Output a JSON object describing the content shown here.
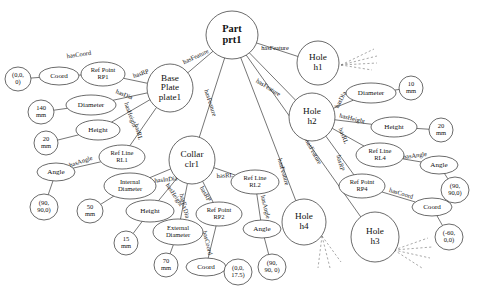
{
  "diagram": {
    "type": "node-link-graph",
    "width": 489,
    "height": 297,
    "background_color": "#ffffff",
    "node_stroke_color": "#2b2b2b",
    "text_color": "#111111",
    "dashed_edge_color": "#6e6e6e"
  },
  "nodes": [
    {
      "id": "prt1",
      "label": "Part\nprt1",
      "line1": "Part",
      "line2": "prt1",
      "shape": "circle",
      "cx": 232,
      "cy": 35,
      "rx": 26,
      "ry": 24,
      "style": "root"
    },
    {
      "id": "plate1",
      "label": "Base Plate plate1",
      "line1": "Base",
      "line2": "Plate",
      "line3": "plate1",
      "shape": "circle",
      "cx": 170,
      "cy": 88,
      "rx": 23,
      "ry": 24,
      "style": "big"
    },
    {
      "id": "clr1",
      "label": "Collar clr1",
      "line1": "Collar",
      "line2": "clr1",
      "shape": "circle",
      "cx": 192,
      "cy": 160,
      "rx": 23,
      "ry": 24,
      "style": "big"
    },
    {
      "id": "h1",
      "label": "Hole h1",
      "line1": "Hole",
      "line2": "h1",
      "shape": "circle",
      "cx": 318,
      "cy": 63,
      "rx": 21,
      "ry": 22,
      "style": "big"
    },
    {
      "id": "h2",
      "label": "Hole h2",
      "line1": "Hole",
      "line2": "h2",
      "shape": "circle",
      "cx": 312,
      "cy": 117,
      "rx": 23,
      "ry": 24,
      "style": "big"
    },
    {
      "id": "h3",
      "label": "Hole h3",
      "line1": "Hole",
      "line2": "h3",
      "shape": "circle",
      "cx": 375,
      "cy": 237,
      "rx": 24,
      "ry": 25,
      "style": "big"
    },
    {
      "id": "h4",
      "label": "Hole h4",
      "line1": "Hole",
      "line2": "h4",
      "shape": "circle",
      "cx": 304,
      "cy": 222,
      "rx": 22,
      "ry": 23,
      "style": "big"
    },
    {
      "id": "coord_p1",
      "label": "Coord",
      "line1": "Coord",
      "shape": "ellipse",
      "cx": 59,
      "cy": 76,
      "rx": 20,
      "ry": 9,
      "style": "normal"
    },
    {
      "id": "rp1",
      "label": "Ref Point RP1",
      "line1": "Ref Point",
      "line2": "RP1",
      "shape": "ellipse",
      "cx": 103,
      "cy": 74,
      "rx": 22,
      "ry": 12,
      "style": "small"
    },
    {
      "id": "val_000_p1",
      "label": "(0,0, 0)",
      "line1": "(0,0,",
      "line2": "0)",
      "shape": "ellipse",
      "cx": 18,
      "cy": 79,
      "rx": 13,
      "ry": 12,
      "style": "small"
    },
    {
      "id": "dia_p1",
      "label": "Diameter",
      "line1": "Diameter",
      "shape": "ellipse",
      "cx": 91,
      "cy": 105,
      "rx": 25,
      "ry": 10,
      "style": "normal"
    },
    {
      "id": "val_140mm",
      "label": "140 mm",
      "line1": "140",
      "line2": "mm",
      "shape": "ellipse",
      "cx": 41,
      "cy": 112,
      "rx": 13,
      "ry": 12,
      "style": "small"
    },
    {
      "id": "hgt_p1",
      "label": "Height",
      "line1": "Height",
      "shape": "ellipse",
      "cx": 98,
      "cy": 130,
      "rx": 22,
      "ry": 10,
      "style": "normal"
    },
    {
      "id": "val_20mm_p1",
      "label": "20 mm",
      "line1": "20",
      "line2": "mm",
      "shape": "ellipse",
      "cx": 46,
      "cy": 143,
      "rx": 12,
      "ry": 12,
      "style": "small"
    },
    {
      "id": "rl1",
      "label": "Ref Line RL1",
      "line1": "Ref Line",
      "line2": "RL1",
      "shape": "ellipse",
      "cx": 122,
      "cy": 157,
      "rx": 23,
      "ry": 12,
      "style": "small"
    },
    {
      "id": "ang_p1",
      "label": "Angle",
      "line1": "Angle",
      "shape": "ellipse",
      "cx": 56,
      "cy": 172,
      "rx": 19,
      "ry": 9,
      "style": "normal"
    },
    {
      "id": "val_ang_p1",
      "label": "(90, 90,0)",
      "line1": "(90,",
      "line2": "90,0)",
      "shape": "ellipse",
      "cx": 44,
      "cy": 207,
      "rx": 14,
      "ry": 13,
      "style": "small"
    },
    {
      "id": "india_c",
      "label": "Internal Diameter",
      "line1": "Internal",
      "line2": "Diameter",
      "shape": "ellipse",
      "cx": 130,
      "cy": 186,
      "rx": 26,
      "ry": 13,
      "style": "small"
    },
    {
      "id": "val_50mm",
      "label": "50 mm",
      "line1": "50",
      "line2": "mm",
      "shape": "ellipse",
      "cx": 90,
      "cy": 211,
      "rx": 13,
      "ry": 12,
      "style": "small"
    },
    {
      "id": "hgt_c",
      "label": "Height",
      "line1": "Height",
      "shape": "ellipse",
      "cx": 150,
      "cy": 211,
      "rx": 24,
      "ry": 11,
      "style": "normal"
    },
    {
      "id": "val_15mm",
      "label": "15 mm",
      "line1": "15",
      "line2": "mm",
      "shape": "ellipse",
      "cx": 126,
      "cy": 243,
      "rx": 12,
      "ry": 12,
      "style": "small"
    },
    {
      "id": "exdia_c",
      "label": "External Diameter",
      "line1": "External",
      "line2": "Diameter",
      "shape": "ellipse",
      "cx": 178,
      "cy": 232,
      "rx": 25,
      "ry": 13,
      "style": "small"
    },
    {
      "id": "val_70mm",
      "label": "70 mm",
      "line1": "70",
      "line2": "mm",
      "shape": "ellipse",
      "cx": 166,
      "cy": 265,
      "rx": 12,
      "ry": 12,
      "style": "small"
    },
    {
      "id": "rp2",
      "label": "Ref Point RP2",
      "line1": "Ref Point",
      "line2": "RP2",
      "shape": "ellipse",
      "cx": 219,
      "cy": 214,
      "rx": 23,
      "ry": 12,
      "style": "small"
    },
    {
      "id": "coord_c",
      "label": "Coord",
      "line1": "Coord",
      "shape": "ellipse",
      "cx": 206,
      "cy": 267,
      "rx": 20,
      "ry": 9,
      "style": "normal"
    },
    {
      "id": "val_00175",
      "label": "(0,0, 17.5)",
      "line1": "(0,0,",
      "line2": "17.5)",
      "shape": "ellipse",
      "cx": 238,
      "cy": 272,
      "rx": 14,
      "ry": 13,
      "style": "small"
    },
    {
      "id": "rl2",
      "label": "Ref Line RL2",
      "line1": "Ref Line",
      "line2": "RL2",
      "shape": "ellipse",
      "cx": 255,
      "cy": 182,
      "rx": 24,
      "ry": 12,
      "style": "small"
    },
    {
      "id": "ang_c",
      "label": "Angle",
      "line1": "Angle",
      "shape": "ellipse",
      "cx": 262,
      "cy": 229,
      "rx": 19,
      "ry": 9,
      "style": "normal"
    },
    {
      "id": "val_ang_c",
      "label": "(90, 90, 0)",
      "line1": "(90,",
      "line2": "90, 0)",
      "shape": "ellipse",
      "cx": 272,
      "cy": 267,
      "rx": 14,
      "ry": 13,
      "style": "small"
    },
    {
      "id": "dia_h2",
      "label": "Diameter",
      "line1": "Diameter",
      "shape": "ellipse",
      "cx": 371,
      "cy": 93,
      "rx": 25,
      "ry": 10,
      "style": "normal"
    },
    {
      "id": "val_10mm",
      "label": "10 mm",
      "line1": "10",
      "line2": "mm",
      "shape": "ellipse",
      "cx": 411,
      "cy": 88,
      "rx": 12,
      "ry": 12,
      "style": "small"
    },
    {
      "id": "hgt_h2",
      "label": "Height",
      "line1": "Height",
      "shape": "ellipse",
      "cx": 394,
      "cy": 127,
      "rx": 23,
      "ry": 10,
      "style": "normal"
    },
    {
      "id": "val_20mm_h2",
      "label": "20 mm",
      "line1": "20",
      "line2": "mm",
      "shape": "ellipse",
      "cx": 441,
      "cy": 130,
      "rx": 12,
      "ry": 12,
      "style": "small"
    },
    {
      "id": "rl4",
      "label": "Ref Line RL4",
      "line1": "Ref Line",
      "line2": "RL4",
      "shape": "ellipse",
      "cx": 380,
      "cy": 155,
      "rx": 24,
      "ry": 12,
      "style": "small"
    },
    {
      "id": "ang_h2",
      "label": "Angle",
      "line1": "Angle",
      "shape": "ellipse",
      "cx": 439,
      "cy": 165,
      "rx": 19,
      "ry": 9,
      "style": "normal"
    },
    {
      "id": "val_ang_h2",
      "label": "(90, 90,0)",
      "line1": "(90,",
      "line2": "90,0)",
      "shape": "ellipse",
      "cx": 455,
      "cy": 190,
      "rx": 14,
      "ry": 13,
      "style": "small"
    },
    {
      "id": "rp4",
      "label": "Ref Point RP4",
      "line1": "Ref Point",
      "line2": "RP4",
      "shape": "ellipse",
      "cx": 362,
      "cy": 186,
      "rx": 23,
      "ry": 12,
      "style": "small"
    },
    {
      "id": "coord_h2",
      "label": "Coord",
      "line1": "Coord",
      "shape": "ellipse",
      "cx": 432,
      "cy": 207,
      "rx": 20,
      "ry": 9,
      "style": "normal"
    },
    {
      "id": "val_m60",
      "label": "(-60, 0,0)",
      "line1": "(-60,",
      "line2": "0,0)",
      "shape": "ellipse",
      "cx": 449,
      "cy": 237,
      "rx": 14,
      "ry": 13,
      "style": "small"
    }
  ],
  "edges": [
    {
      "id": "e1",
      "from": "prt1",
      "to": "h1",
      "label": "hasFeature",
      "lx": 275,
      "ly": 49,
      "rot": 0
    },
    {
      "id": "e2",
      "from": "prt1",
      "to": "plate1",
      "label": "hasFeature",
      "lx": 196,
      "ly": 57,
      "rot": -25
    },
    {
      "id": "e3",
      "from": "prt1",
      "to": "clr1",
      "label": "hasFeature",
      "lx": 210,
      "ly": 103,
      "rot": 72
    },
    {
      "id": "e4",
      "from": "prt1",
      "to": "h2",
      "label": "hasFeature",
      "lx": 268,
      "ly": 88,
      "rot": 32
    },
    {
      "id": "e5",
      "from": "prt1",
      "to": "h4",
      "label": "hasFeature",
      "lx": 283,
      "ly": 172,
      "rot": 74
    },
    {
      "id": "e6",
      "from": "prt1",
      "to": "h3",
      "label": "hasFeature",
      "lx": 313,
      "ly": 152,
      "rot": 61
    },
    {
      "id": "e7",
      "from": "plate1",
      "to": "rp1",
      "label": "hasRP",
      "lx": 141,
      "ly": 74,
      "rot": -18
    },
    {
      "id": "e8",
      "from": "rp1",
      "to": "coord_p1",
      "label": "hasCoord",
      "lx": 79,
      "ly": 55,
      "rot": -8
    },
    {
      "id": "e9",
      "from": "coord_p1",
      "to": "val_000_p1",
      "label": "",
      "lx": 0,
      "ly": 0,
      "rot": 0
    },
    {
      "id": "e10",
      "from": "plate1",
      "to": "dia_p1",
      "label": "hasDia",
      "lx": 124,
      "ly": 95,
      "rot": 22
    },
    {
      "id": "e11",
      "from": "dia_p1",
      "to": "val_140mm",
      "label": "",
      "lx": 0,
      "ly": 0,
      "rot": 0
    },
    {
      "id": "e12",
      "from": "plate1",
      "to": "hgt_p1",
      "label": "hasHeight",
      "lx": 130,
      "ly": 115,
      "rot": 70
    },
    {
      "id": "e13",
      "from": "hgt_p1",
      "to": "val_20mm_p1",
      "label": "",
      "lx": 0,
      "ly": 0,
      "rot": 0
    },
    {
      "id": "e14",
      "from": "plate1",
      "to": "rl1",
      "label": "hasRL",
      "lx": 138,
      "ly": 132,
      "rot": 74
    },
    {
      "id": "e15",
      "from": "rl1",
      "to": "ang_p1",
      "label": "hasAngle",
      "lx": 81,
      "ly": 162,
      "rot": -19
    },
    {
      "id": "e16",
      "from": "ang_p1",
      "to": "val_ang_p1",
      "label": "",
      "lx": 0,
      "ly": 0,
      "rot": 0
    },
    {
      "id": "e17",
      "from": "clr1",
      "to": "india_c",
      "label": "hasInDia",
      "lx": 166,
      "ly": 180,
      "rot": -6
    },
    {
      "id": "e18",
      "from": "india_c",
      "to": "val_50mm",
      "label": "",
      "lx": 0,
      "ly": 0,
      "rot": 0
    },
    {
      "id": "e19",
      "from": "clr1",
      "to": "hgt_c",
      "label": "hasHeight",
      "lx": 174,
      "ly": 195,
      "rot": 56
    },
    {
      "id": "e20",
      "from": "hgt_c",
      "to": "val_15mm",
      "label": "",
      "lx": 0,
      "ly": 0,
      "rot": 0
    },
    {
      "id": "e21",
      "from": "clr1",
      "to": "exdia_c",
      "label": "hasExDia",
      "lx": 184,
      "ly": 206,
      "rot": 76
    },
    {
      "id": "e22",
      "from": "exdia_c",
      "to": "val_70mm",
      "label": "",
      "lx": 0,
      "ly": 0,
      "rot": 0
    },
    {
      "id": "e23",
      "from": "clr1",
      "to": "rp2",
      "label": "hasRP",
      "lx": 205,
      "ly": 194,
      "rot": 60
    },
    {
      "id": "e24",
      "from": "rp2",
      "to": "coord_c",
      "label": "hasCoord",
      "lx": 207,
      "ly": 243,
      "rot": 76
    },
    {
      "id": "e25",
      "from": "coord_c",
      "to": "val_00175",
      "label": "",
      "lx": 0,
      "ly": 0,
      "rot": 0
    },
    {
      "id": "e26",
      "from": "clr1",
      "to": "rl2",
      "label": "hasRL",
      "lx": 225,
      "ly": 176,
      "rot": -3
    },
    {
      "id": "e27",
      "from": "rl2",
      "to": "ang_c",
      "label": "hasAngle",
      "lx": 265,
      "ly": 207,
      "rot": 76
    },
    {
      "id": "e28",
      "from": "ang_c",
      "to": "val_ang_c",
      "label": "",
      "lx": 0,
      "ly": 0,
      "rot": 0
    },
    {
      "id": "e29",
      "from": "h2",
      "to": "dia_h2",
      "label": "hasDia",
      "lx": 341,
      "ly": 100,
      "rot": -62
    },
    {
      "id": "e30",
      "from": "dia_h2",
      "to": "val_10mm",
      "label": "",
      "lx": 0,
      "ly": 0,
      "rot": 0
    },
    {
      "id": "e31",
      "from": "h2",
      "to": "hgt_h2",
      "label": "hasHeight",
      "lx": 352,
      "ly": 119,
      "rot": 14
    },
    {
      "id": "e32",
      "from": "hgt_h2",
      "to": "val_20mm_h2",
      "label": "",
      "lx": 0,
      "ly": 0,
      "rot": 0
    },
    {
      "id": "e33",
      "from": "h2",
      "to": "rl4",
      "label": "hasRL",
      "lx": 343,
      "ly": 136,
      "rot": 68
    },
    {
      "id": "e34",
      "from": "rl4",
      "to": "ang_h2",
      "label": "hasAngle",
      "lx": 415,
      "ly": 156,
      "rot": -7
    },
    {
      "id": "e35",
      "from": "ang_h2",
      "to": "val_ang_h2",
      "label": "",
      "lx": 0,
      "ly": 0,
      "rot": 0
    },
    {
      "id": "e36",
      "from": "h2",
      "to": "rp4",
      "label": "hasRP",
      "lx": 340,
      "ly": 163,
      "rot": 76
    },
    {
      "id": "e37",
      "from": "rp4",
      "to": "coord_h2",
      "label": "hasCoord",
      "lx": 401,
      "ly": 194,
      "rot": 17
    },
    {
      "id": "e38",
      "from": "coord_h2",
      "to": "val_m60",
      "label": "",
      "lx": 0,
      "ly": 0,
      "rot": 0
    }
  ],
  "dashed_fans": [
    {
      "id": "fan-h1",
      "origin_x": 341,
      "origin_y": 65,
      "rays": [
        [
          374,
          49
        ],
        [
          377,
          56
        ],
        [
          377,
          63
        ],
        [
          372,
          70
        ]
      ]
    },
    {
      "id": "fan-h3",
      "origin_x": 394,
      "origin_y": 250,
      "rays": [
        [
          428,
          238
        ],
        [
          432,
          247
        ],
        [
          430,
          258
        ],
        [
          422,
          268
        ]
      ]
    },
    {
      "id": "fan-h4",
      "origin_x": 322,
      "origin_y": 236,
      "rays": [
        [
          318,
          268
        ],
        [
          330,
          268
        ],
        [
          341,
          262
        ]
      ]
    }
  ],
  "legend": {
    "relations": [
      "hasFeature",
      "hasRP",
      "hasCoord",
      "hasDia",
      "hasHeight",
      "hasRL",
      "hasAngle",
      "hasInDia",
      "hasExDia"
    ],
    "entity_classes": [
      "Part",
      "Base Plate",
      "Collar",
      "Hole",
      "Coord",
      "Ref Point",
      "Ref Line",
      "Diameter",
      "Height",
      "Angle",
      "Internal Diameter",
      "External Diameter"
    ]
  }
}
